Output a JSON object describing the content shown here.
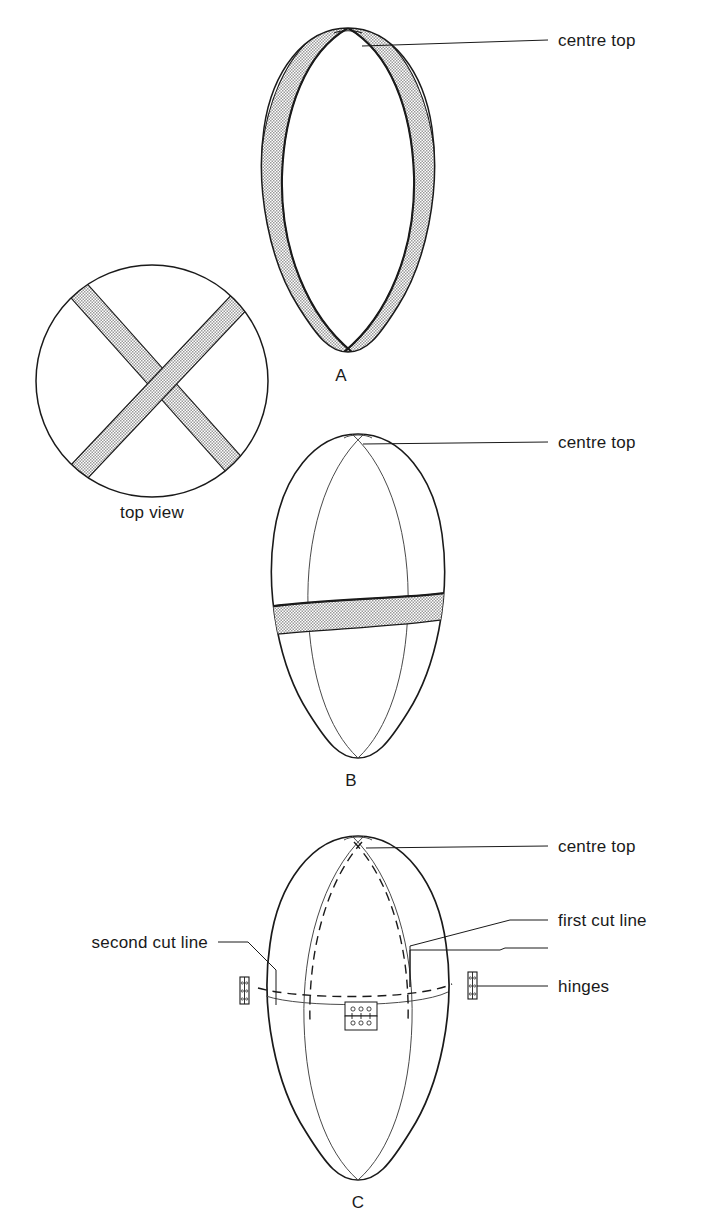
{
  "document": {
    "type": "technical-line-diagram",
    "subject": "egg cutting and hinging layout",
    "background_color": "#ffffff",
    "line_color": "#1a1a1a",
    "band_fill_color": "#d2d2d2"
  },
  "figures": [
    {
      "id": "A",
      "caption": "A",
      "description": "egg with two crossing shaded bands meeting at centre top",
      "annotations": [
        {
          "name": "centre-top",
          "label": "centre top"
        }
      ]
    },
    {
      "id": "top-view",
      "caption": "top view",
      "description": "circle with two crossing shaded bands forming an X"
    },
    {
      "id": "B",
      "caption": "B",
      "description": "egg with meridian lines and one horizontal shaded band",
      "annotations": [
        {
          "name": "centre-top",
          "label": "centre top"
        }
      ]
    },
    {
      "id": "C",
      "caption": "C",
      "description": "egg with cut lines and hinges",
      "annotations": [
        {
          "name": "centre-top",
          "label": "centre top"
        },
        {
          "name": "first-cut-line",
          "label": "first cut line"
        },
        {
          "name": "second-cut-line",
          "label": "second cut line"
        },
        {
          "name": "hinges",
          "label": "hinges"
        }
      ]
    }
  ],
  "labels": {
    "centre_top_a": "centre top",
    "centre_top_b": "centre top",
    "centre_top_c": "centre top",
    "top_view": "top view",
    "first_cut_line": "first cut line",
    "second_cut_line": "second cut line",
    "hinges": "hinges",
    "fig_a": "A",
    "fig_b": "B",
    "fig_c": "C"
  }
}
